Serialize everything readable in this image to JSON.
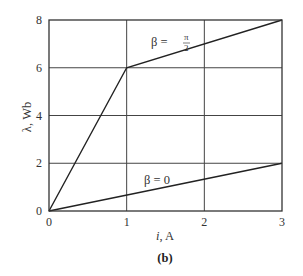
{
  "chart_data": {
    "type": "line",
    "title": "",
    "caption": "(b)",
    "xlabel": "i, A",
    "xlabel_italic_part": "i",
    "xlabel_rest": ", A",
    "ylabel": "λ, Wb",
    "xlim": [
      0,
      3
    ],
    "ylim": [
      0,
      8
    ],
    "xticks": [
      0,
      1,
      2,
      3
    ],
    "yticks": [
      0,
      2,
      4,
      6,
      8
    ],
    "xtick_labels": [
      "0",
      "1",
      "2",
      "3"
    ],
    "ytick_labels": [
      "0",
      "2",
      "4",
      "6",
      "8"
    ],
    "grid": true,
    "legend": "none (inline annotations)",
    "series": [
      {
        "name": "β = π/2",
        "label_prefix": "β =",
        "label_num": "π",
        "label_den": "2",
        "x": [
          0,
          1,
          3
        ],
        "y": [
          0,
          6,
          8
        ]
      },
      {
        "name": "β = 0",
        "label": "β = 0",
        "x": [
          0,
          3
        ],
        "y": [
          0,
          2
        ]
      }
    ]
  },
  "layout": {
    "plot_left": 49,
    "plot_top": 20,
    "plot_right": 282,
    "plot_bottom": 211,
    "line_color": "#222222",
    "grid_color": "#444444"
  }
}
